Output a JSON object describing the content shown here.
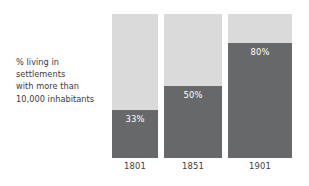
{
  "chart_data": {
    "type": "bar",
    "title": "",
    "subtitle": "",
    "xlabel": "",
    "ylabel": "% living in settlements with more than 10,000 inhabitants",
    "ylim": [
      0,
      100
    ],
    "grid": false,
    "legend": "none",
    "stacked": true,
    "categories": [
      "1801",
      "1851",
      "1901"
    ],
    "values": [
      33,
      50,
      80
    ],
    "data_labels": [
      "33%",
      "50%",
      "80%"
    ],
    "series": [
      {
        "name": "% living in settlements with more than 10,000 inhabitants",
        "values": [
          33,
          50,
          80
        ],
        "color": "#676869"
      },
      {
        "name": "remainder",
        "values": [
          67,
          50,
          20
        ],
        "color": "#d9dad9"
      }
    ]
  },
  "caption": {
    "line1": "% living in",
    "line2": "settlements",
    "line3": "with more than",
    "line4": "10,000 inhabitants"
  },
  "bars": [
    {
      "label": "1801",
      "value_label": "33%",
      "percent": 33
    },
    {
      "label": "1851",
      "value_label": "50%",
      "percent": 50
    },
    {
      "label": "1901",
      "value_label": "80%",
      "percent": 80
    }
  ],
  "colors": {
    "dark": "#676869",
    "light": "#d9dad9",
    "text": "#3b3b3b",
    "value_text": "#ffffff",
    "background": "#ffffff"
  }
}
